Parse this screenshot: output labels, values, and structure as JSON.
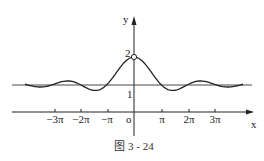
{
  "figure": {
    "caption": "图 3 - 24",
    "axes": {
      "x_label": "x",
      "y_label": "y",
      "origin_label": "o"
    },
    "y_ticks": [
      {
        "label": "1",
        "value": 1
      },
      {
        "label": "2",
        "value": 2
      }
    ],
    "x_ticks": [
      {
        "label": "−3π",
        "value": -3
      },
      {
        "label": "−2π",
        "value": -2
      },
      {
        "label": "−π",
        "value": -1
      },
      {
        "label": "π",
        "value": 1
      },
      {
        "label": "2π",
        "value": 2
      },
      {
        "label": "3π",
        "value": 3
      }
    ],
    "curve": "y = 1 + sin(x)/x",
    "asymptote": "y = 1",
    "hole": {
      "x": 0,
      "y": 2
    },
    "colors": {
      "stroke": "#222222",
      "background": "#ffffff"
    }
  }
}
